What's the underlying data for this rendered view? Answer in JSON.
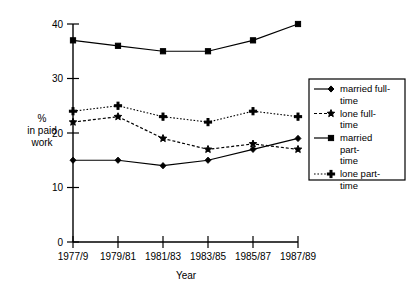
{
  "chart_data": {
    "type": "line",
    "title": "",
    "xlabel": "Year",
    "ylabel": "% in paid work",
    "ylabel_lines": [
      "%",
      "in paid",
      "work"
    ],
    "categories": [
      "1977/9",
      "1979/81",
      "1981/83",
      "1983/85",
      "1985/87",
      "1987/89"
    ],
    "ylim": [
      0,
      40
    ],
    "yticks": [
      0,
      10,
      20,
      30,
      40
    ],
    "ytick_labels": [
      "0",
      "10",
      "20",
      "30",
      "40"
    ],
    "grid": false,
    "legend_position": "right",
    "series": [
      {
        "name": "married full-time",
        "label_lines": [
          "married full-",
          "time"
        ],
        "values": [
          15,
          15,
          14,
          15,
          17,
          19
        ],
        "line_style": "solid",
        "marker": "diamond",
        "color": "#000000"
      },
      {
        "name": "lone full-time",
        "label_lines": [
          "lone full-",
          "time"
        ],
        "values": [
          22,
          23,
          19,
          17,
          18,
          17
        ],
        "line_style": "dashed",
        "marker": "star",
        "color": "#000000"
      },
      {
        "name": "married part-time",
        "label_lines": [
          "married",
          "part-",
          "time"
        ],
        "values": [
          37,
          36,
          35,
          35,
          37,
          40
        ],
        "line_style": "solid",
        "marker": "square",
        "color": "#000000"
      },
      {
        "name": "lone part-time",
        "label_lines": [
          "lone part-",
          "time"
        ],
        "values": [
          24,
          25,
          23,
          22,
          24,
          23
        ],
        "line_style": "dotted",
        "marker": "plus",
        "color": "#000000"
      }
    ]
  },
  "axes": {
    "x_axis_title": "Year",
    "y_axis_title_line1": "%",
    "y_axis_title_line2": "in paid",
    "y_axis_title_line3": "work"
  },
  "legend": {
    "entries": [
      {
        "line1": "married full-",
        "line2": "time",
        "line3": ""
      },
      {
        "line1": "lone full-",
        "line2": "time",
        "line3": ""
      },
      {
        "line1": "married",
        "line2": "part-",
        "line3": "time"
      },
      {
        "line1": "lone part-",
        "line2": "time",
        "line3": ""
      }
    ]
  },
  "xtick_labels": {
    "t0": "1977/9",
    "t1": "1979/81",
    "t2": "1981/83",
    "t3": "1983/85",
    "t4": "1985/87",
    "t5": "1987/89"
  },
  "ytick_labels": {
    "y0": "0",
    "y10": "10",
    "y20": "20",
    "y30": "30",
    "y40": "40"
  }
}
